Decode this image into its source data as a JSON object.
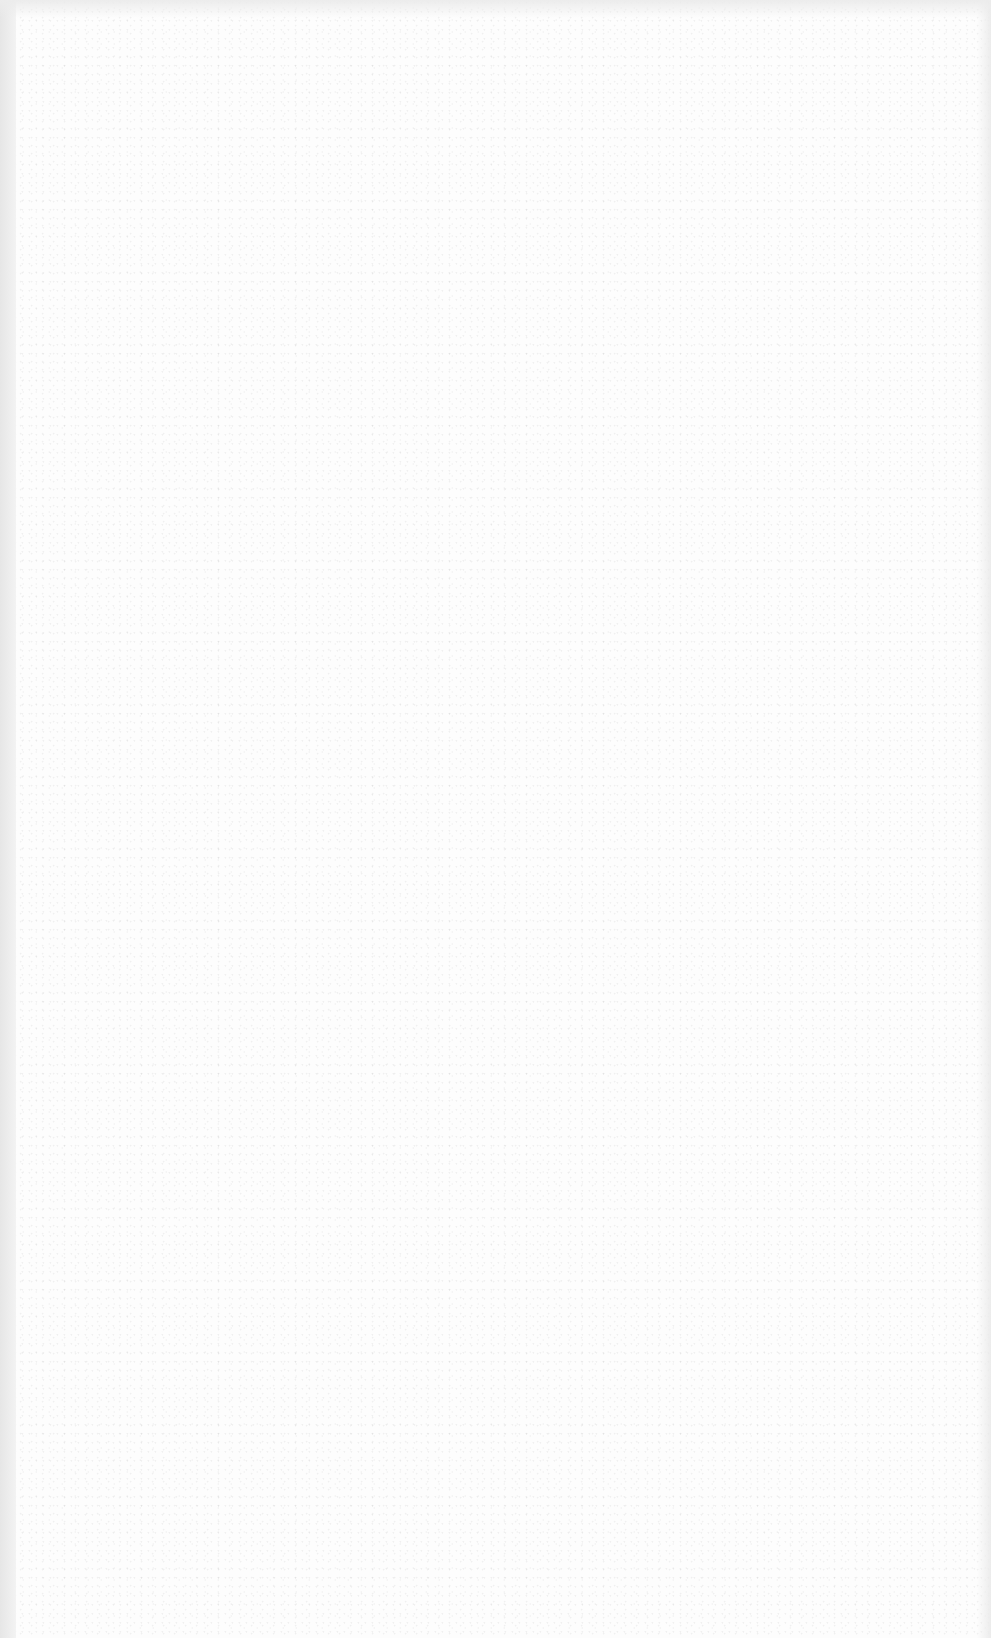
{
  "document": {
    "type": "blank scanned page",
    "visible_text": [],
    "faint_bleed_through": {
      "title": "",
      "subtitle": ""
    }
  }
}
